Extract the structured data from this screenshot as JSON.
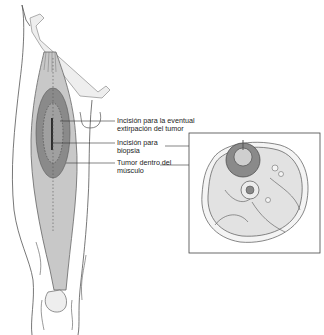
{
  "figure": {
    "labels": [
      {
        "id": "excision",
        "lines": [
          "Incisión para la eventual",
          "extirpación del tumor"
        ]
      },
      {
        "id": "biopsy",
        "lines": [
          "Incisión para",
          "biopsia"
        ]
      },
      {
        "id": "tumor",
        "lines": [
          "Tumor dentro del",
          "músculo"
        ]
      }
    ],
    "colors": {
      "outline": "#555555",
      "muscle_fill": "#c8c8c8",
      "tumor_outer": "#8a8a8a",
      "tumor_inner": "#a8a8a8",
      "bone_fill": "#e6e6e6",
      "crosssection_fill": "#e0e0e0"
    }
  }
}
